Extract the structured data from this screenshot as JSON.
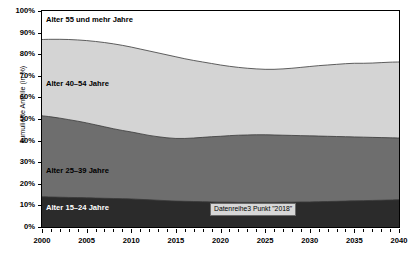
{
  "chart_data": {
    "type": "area",
    "title": "",
    "xlabel": "",
    "ylabel": "kumulierte Anteile (in %)",
    "stacked": true,
    "cumulative": true,
    "grid": false,
    "legend_position": "inline-labels",
    "xlim": [
      2000,
      2040
    ],
    "ylim": [
      0,
      100
    ],
    "x": [
      2000,
      2001,
      2002,
      2003,
      2004,
      2005,
      2006,
      2007,
      2008,
      2009,
      2010,
      2011,
      2012,
      2013,
      2014,
      2015,
      2016,
      2017,
      2018,
      2019,
      2020,
      2021,
      2022,
      2023,
      2024,
      2025,
      2026,
      2027,
      2028,
      2029,
      2030,
      2031,
      2032,
      2033,
      2034,
      2035,
      2036,
      2037,
      2038,
      2039,
      2040
    ],
    "xticks": [
      2000,
      2005,
      2010,
      2015,
      2020,
      2025,
      2030,
      2035,
      2040
    ],
    "xticklabels": [
      "2000",
      "2005",
      "2010",
      "2015",
      "2020",
      "2025",
      "2030",
      "2035",
      "2040"
    ],
    "yticks": [
      0,
      10,
      20,
      30,
      40,
      50,
      60,
      70,
      80,
      90,
      100
    ],
    "yticklabels": [
      "0%",
      "10%",
      "20%",
      "30%",
      "40%",
      "50%",
      "60%",
      "70%",
      "80%",
      "90%",
      "100%"
    ],
    "series": [
      {
        "name": "Alter 15–24 Jahre",
        "label": "Alter 15–24 Jahre",
        "color": "#2b2b2b",
        "label_color": "#ffffff",
        "cumulative_values": [
          14.0,
          13.9,
          13.8,
          13.7,
          13.6,
          13.5,
          13.4,
          13.3,
          13.2,
          13.1,
          13.0,
          12.8,
          12.6,
          12.4,
          12.2,
          12.0,
          11.9,
          11.8,
          11.7,
          11.6,
          11.5,
          11.5,
          11.4,
          11.4,
          11.4,
          11.4,
          11.4,
          11.5,
          11.5,
          11.6,
          11.6,
          11.7,
          11.8,
          11.9,
          12.0,
          12.1,
          12.2,
          12.3,
          12.4,
          12.5,
          12.6
        ]
      },
      {
        "name": "Alter 25–39 Jahre",
        "label": "Alter 25–39 Jahre",
        "color": "#6e6e6e",
        "label_color": "#000000",
        "cumulative_values": [
          51.5,
          51.0,
          50.4,
          49.7,
          49.0,
          48.2,
          47.3,
          46.4,
          45.5,
          44.7,
          44.0,
          43.2,
          42.4,
          41.8,
          41.3,
          41.0,
          41.0,
          41.2,
          41.5,
          41.8,
          42.0,
          42.3,
          42.5,
          42.6,
          42.7,
          42.7,
          42.6,
          42.5,
          42.4,
          42.3,
          42.2,
          42.1,
          42.0,
          41.9,
          41.8,
          41.7,
          41.6,
          41.5,
          41.4,
          41.3,
          41.2
        ]
      },
      {
        "name": "Alter 40–54 Jahre",
        "label": "Alter 40–54 Jahre",
        "color": "#d4d4d4",
        "label_color": "#000000",
        "cumulative_values": [
          86.8,
          86.9,
          86.9,
          86.8,
          86.6,
          86.3,
          85.9,
          85.4,
          84.8,
          84.1,
          83.3,
          82.4,
          81.5,
          80.6,
          79.7,
          78.8,
          77.9,
          77.1,
          76.4,
          75.7,
          75.0,
          74.4,
          73.9,
          73.5,
          73.2,
          73.0,
          73.0,
          73.2,
          73.5,
          73.9,
          74.3,
          74.7,
          75.0,
          75.3,
          75.6,
          75.8,
          75.8,
          75.9,
          76.1,
          76.3,
          76.4
        ]
      },
      {
        "name": "Alter 55 und mehr Jahre",
        "label": "Alter 55 und mehr Jahre",
        "color": "#ffffff",
        "label_color": "#000000",
        "cumulative_values": [
          100,
          100,
          100,
          100,
          100,
          100,
          100,
          100,
          100,
          100,
          100,
          100,
          100,
          100,
          100,
          100,
          100,
          100,
          100,
          100,
          100,
          100,
          100,
          100,
          100,
          100,
          100,
          100,
          100,
          100,
          100,
          100,
          100,
          100,
          100,
          100,
          100,
          100,
          100,
          100,
          100
        ]
      }
    ],
    "annotations": [
      {
        "name": "tooltip",
        "text": "Datenreihe3 Punkt \"2018\""
      }
    ]
  },
  "axis": {
    "ylabel": "kumulierte Anteile (in %)"
  },
  "tooltip": {
    "text": "Datenreihe3 Punkt \"2018\""
  },
  "labels": {
    "s55": "Alter 55 und mehr Jahre",
    "s40": "Alter 40–54 Jahre",
    "s25": "Alter 25–39 Jahre",
    "s15": "Alter 15–24 Jahre"
  }
}
